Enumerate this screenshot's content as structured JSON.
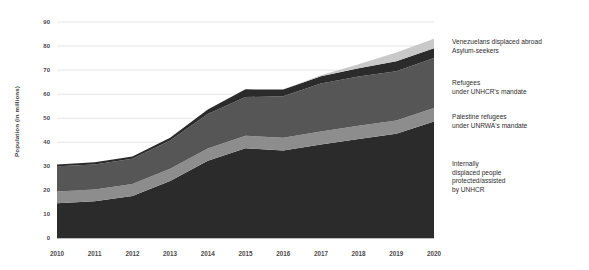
{
  "chart_data": {
    "type": "area",
    "stacked": true,
    "title": "",
    "subtitle": "",
    "xlabel": "",
    "ylabel": "Population (in millions)",
    "x": [
      2010,
      2011,
      2012,
      2013,
      2014,
      2015,
      2016,
      2017,
      2018,
      2019,
      2020
    ],
    "categories": [
      "2010",
      "2011",
      "2012",
      "2013",
      "2014",
      "2015",
      "2016",
      "2017",
      "2018",
      "2019",
      "2020"
    ],
    "xlim": [
      2010,
      2020
    ],
    "ylim": [
      0,
      90
    ],
    "yticks": [
      0,
      10,
      20,
      30,
      40,
      50,
      60,
      70,
      80,
      90
    ],
    "grid": true,
    "grid_axis": "y",
    "legend_position": "right-inline",
    "series": [
      {
        "name": "Internally displaced people protected/assisted by UNHCR",
        "color": "#2b2b2b",
        "values": [
          14.7,
          15.5,
          17.7,
          23.9,
          32.3,
          37.5,
          36.6,
          39.1,
          41.4,
          43.5,
          48.6
        ]
      },
      {
        "name": "Palestine refugees under UNRWA's mandate",
        "color": "#8d8d8d",
        "values": [
          4.8,
          4.9,
          5.0,
          5.1,
          5.1,
          5.2,
          5.3,
          5.4,
          5.5,
          5.6,
          5.7
        ]
      },
      {
        "name": "Refugees under UNHCR's mandate",
        "color": "#565656",
        "values": [
          10.5,
          10.4,
          10.5,
          11.7,
          14.4,
          16.1,
          17.2,
          19.9,
          20.4,
          20.4,
          20.7
        ]
      },
      {
        "name": "Asylum-seekers",
        "color": "#2b2b2b",
        "values": [
          0.8,
          0.9,
          0.9,
          1.2,
          1.8,
          3.2,
          2.8,
          3.1,
          3.5,
          4.2,
          4.1
        ]
      },
      {
        "name": "Venezuelans displaced abroad",
        "color": "#c9c9c9",
        "values": [
          0.0,
          0.0,
          0.0,
          0.0,
          0.0,
          0.0,
          0.0,
          0.4,
          1.6,
          3.6,
          3.9
        ]
      }
    ],
    "totals": [
      30.8,
      31.7,
      34.1,
      41.9,
      53.6,
      62.0,
      61.9,
      67.9,
      72.4,
      77.3,
      83.0
    ]
  },
  "axis": {
    "y_title": "Population (in millions)",
    "y_labels": [
      "90",
      "80",
      "70",
      "60",
      "50",
      "40",
      "30",
      "20",
      "10",
      "0"
    ],
    "x_labels": [
      "2010",
      "2011",
      "2012",
      "2013",
      "2014",
      "2015",
      "2016",
      "2017",
      "2018",
      "2019",
      "2020"
    ]
  },
  "legend": {
    "groups": [
      {
        "id": "venezuelans-asylum",
        "lines": [
          "Venezuelans displaced abroad",
          "Asylum-seekers"
        ]
      },
      {
        "id": "refugees-unhcr",
        "lines": [
          "Refugees",
          "under UNHCR's mandate"
        ]
      },
      {
        "id": "palestine-unrwa",
        "lines": [
          "Palestine refugees",
          "under UNRWA's mandate"
        ]
      },
      {
        "id": "idp-unhcr",
        "lines": [
          "Internally",
          "displaced people",
          "protected/assisted",
          "by UNHCR"
        ]
      }
    ]
  },
  "colors": {
    "idp": "#2b2b2b",
    "palestine": "#8d8d8d",
    "refugees": "#565656",
    "asylum": "#2b2b2b",
    "venezuelans": "#c9c9c9",
    "grid": "#e6e6e6",
    "axis_text": "#4a4a4a",
    "background": "#ffffff"
  }
}
